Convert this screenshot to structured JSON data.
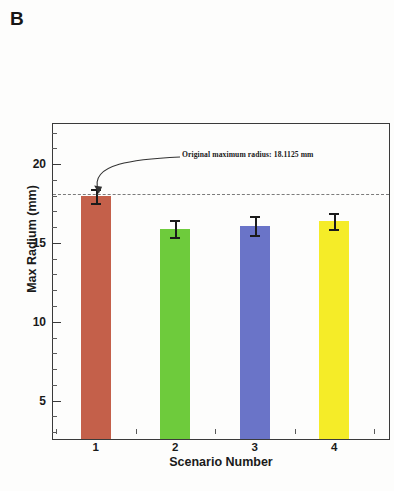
{
  "panel": {
    "label": "B"
  },
  "chart_data": {
    "type": "bar",
    "title": "",
    "subtitle": "",
    "xlabel": "Scenario Number",
    "ylabel": "Max Radium (mm)",
    "categories": [
      "1",
      "2",
      "3",
      "4"
    ],
    "values": [
      18.0,
      15.9,
      16.1,
      16.4
    ],
    "errors": [
      0.45,
      0.55,
      0.6,
      0.5
    ],
    "colors": [
      "#c4604a",
      "#6ecb3c",
      "#6a74c8",
      "#f5ec28"
    ],
    "ylim": [
      2.5,
      22.6
    ],
    "xlim": [
      0.45,
      4.7
    ],
    "ytick_labels": [
      "5",
      "10",
      "15",
      "20"
    ],
    "ytick_values": [
      5,
      10,
      15,
      20
    ],
    "ytick_minor_values": [
      3,
      4,
      6,
      7,
      8,
      9,
      11,
      12,
      13,
      14,
      16,
      17,
      18,
      19,
      21,
      22
    ],
    "xtick_labels": [
      "1",
      "2",
      "3",
      "4"
    ],
    "xtick_values": [
      1,
      2,
      3,
      4
    ],
    "xtick_minor_values": [
      0.5,
      1.5,
      2.5,
      3.5,
      4.5
    ],
    "grid": false,
    "legend": false,
    "reference_line": {
      "value": 18.1125,
      "style": "dashed",
      "color": "#7b7b7b",
      "annotation": "Original maximum radius: 18.1125 mm"
    },
    "annotations": [
      {
        "text": "Original maximum radius: 18.1125 mm",
        "points_to_x": 1.0,
        "points_to_y": 18.1125
      }
    ]
  }
}
